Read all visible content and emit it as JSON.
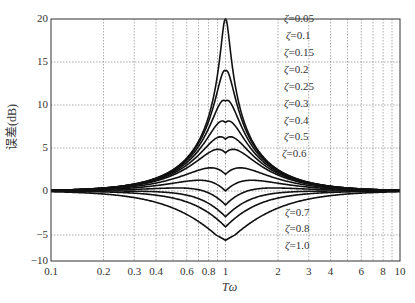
{
  "chart_data": {
    "type": "line",
    "title": "",
    "xlabel": "Tω",
    "ylabel": "误差(dB)",
    "xscale": "log",
    "xlim": [
      0.1,
      10
    ],
    "ylim": [
      -10,
      20
    ],
    "grid": true,
    "x_ticks": [
      "0.1",
      "0.2",
      "0.3",
      "0.4",
      "0.6",
      "0.8",
      "1",
      "2",
      "3",
      "4",
      "6",
      "8",
      "10"
    ],
    "y_ticks": [
      "20",
      "15",
      "10",
      "5",
      "0",
      "-5",
      "-10"
    ],
    "formula": "error = -20·log10(sqrt((1-(Tω)^2)^2 + (2ζTω)^2)) - asymptote",
    "series": [
      {
        "name": "ζ=0.05",
        "zeta": 0.05,
        "peak_at_1": 20.0
      },
      {
        "name": "ζ=0.1",
        "zeta": 0.1,
        "peak_at_1": 13.98
      },
      {
        "name": "ζ=0.15",
        "zeta": 0.15,
        "peak_at_1": 10.46
      },
      {
        "name": "ζ=0.2",
        "zeta": 0.2,
        "peak_at_1": 7.96
      },
      {
        "name": "ζ=0.25",
        "zeta": 0.25,
        "peak_at_1": 6.02
      },
      {
        "name": "ζ=0.3",
        "zeta": 0.3,
        "peak_at_1": 4.44
      },
      {
        "name": "ζ=0.4",
        "zeta": 0.4,
        "peak_at_1": 1.94
      },
      {
        "name": "ζ=0.5",
        "zeta": 0.5,
        "peak_at_1": 0.0
      },
      {
        "name": "ζ=0.6",
        "zeta": 0.6,
        "peak_at_1": -1.58
      },
      {
        "name": "ζ=0.7",
        "zeta": 0.7,
        "peak_at_1": -2.92
      },
      {
        "name": "ζ=0.8",
        "zeta": 0.8,
        "peak_at_1": -4.08
      },
      {
        "name": "ζ=1.0",
        "zeta": 1.0,
        "peak_at_1": -6.02
      }
    ],
    "legend_position": "inline-right-of-peak"
  },
  "axis": {
    "ylabel": "误差(dB)",
    "xlabel": "Tω"
  },
  "legend": {
    "upper": [
      "=0.05",
      "=0.1",
      "=0.15",
      "=0.2",
      "=0.25",
      "=0.3",
      "=0.4",
      "=0.5",
      "=0.6"
    ],
    "lower": [
      "=0.7",
      "=0.8",
      "=1.0"
    ],
    "symbol": "ζ"
  },
  "style": {
    "line_color": "#111111",
    "grid_color": "#888888",
    "frame_color": "#333333"
  }
}
